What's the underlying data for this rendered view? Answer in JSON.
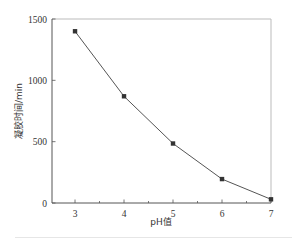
{
  "chart_data": {
    "type": "line",
    "title": "",
    "xlabel": "pH值",
    "ylabel": "凝胶时间/min",
    "x": [
      3,
      4,
      5,
      6,
      7
    ],
    "series": [
      {
        "name": "凝胶时间",
        "values": [
          1400,
          870,
          485,
          195,
          30
        ],
        "marker": "square",
        "color": "#555555"
      }
    ],
    "xlim": [
      2.53,
      7
    ],
    "ylim": [
      0,
      1500
    ],
    "xticks": [
      3,
      4,
      5,
      6,
      7
    ],
    "xticks_minor": [
      3.5,
      4.5,
      5.5,
      6.5
    ],
    "yticks": [
      0,
      500,
      1000,
      1500
    ],
    "xtick_labels": [
      "3",
      "4",
      "5",
      "6",
      "7"
    ],
    "ytick_labels": [
      "0",
      "500",
      "1000",
      "1500"
    ],
    "grid": false,
    "legend": null
  },
  "colors": {
    "axis": "#555555",
    "frame": "#bbbbbb",
    "line": "#555555",
    "marker": "#333333",
    "text": "#333333"
  }
}
